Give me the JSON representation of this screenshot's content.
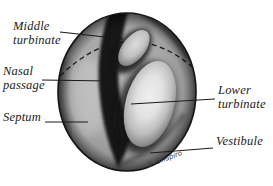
{
  "labels": {
    "middle_turbinate": "Middle\nturbinate",
    "nasal_passage": "Nasal\npassage",
    "septum": "Septum",
    "lower_turbinate": "Lower\nturbinate",
    "vestibule": "Vestibule"
  },
  "signature": "S. Shapiro",
  "colors": {
    "background": "#ffffff",
    "label_text": "#1a1a1a",
    "leader_line": "#1a1a1a",
    "outline": "#141414",
    "base_gray": "#a9a9a9",
    "turbinate_highlight": "#efefef",
    "passage_shadow": "#161616"
  }
}
